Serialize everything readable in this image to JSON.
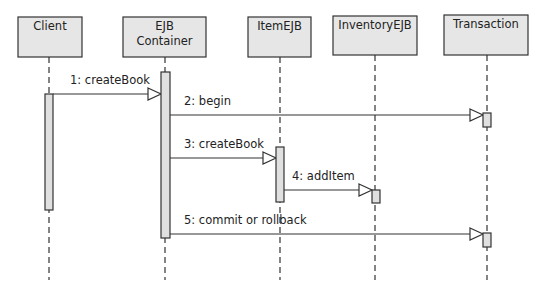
{
  "diagram": {
    "type": "uml-sequence",
    "colors": {
      "box_fill": "#e6e6e6",
      "stroke": "#333333",
      "activation_fill": "#e0e0e0",
      "text": "#222222"
    },
    "participants": [
      {
        "id": "client",
        "lines": [
          "Client"
        ],
        "box": [
          18,
          17,
          64,
          40
        ],
        "lifeline_x": 49
      },
      {
        "id": "container",
        "lines": [
          "EJB",
          "Container"
        ],
        "box": [
          123,
          17,
          83,
          40
        ],
        "lifeline_x": 165
      },
      {
        "id": "item",
        "lines": [
          "ItemEJB"
        ],
        "box": [
          248,
          17,
          63,
          40
        ],
        "lifeline_x": 280
      },
      {
        "id": "inventory",
        "lines": [
          "InventoryEJB"
        ],
        "box": [
          333,
          16,
          84,
          39
        ],
        "lifeline_x": 375
      },
      {
        "id": "transaction",
        "lines": [
          "Transaction"
        ],
        "box": [
          444,
          15,
          84,
          40
        ],
        "lifeline_x": 487
      }
    ],
    "activations": [
      {
        "participant": "client",
        "x": 45,
        "y": 94,
        "w": 8,
        "h": 116
      },
      {
        "participant": "container",
        "x": 161,
        "y": 72,
        "w": 9,
        "h": 166
      },
      {
        "participant": "item",
        "x": 276,
        "y": 147,
        "w": 8,
        "h": 55
      },
      {
        "participant": "inventory",
        "x": 372,
        "y": 190,
        "w": 8,
        "h": 13
      },
      {
        "participant": "transaction",
        "x": 483,
        "y": 113,
        "w": 8,
        "h": 14
      },
      {
        "participant": "transaction",
        "x": 483,
        "y": 233,
        "w": 8,
        "h": 14
      }
    ],
    "messages": [
      {
        "seq": "1",
        "label": "1: createBook",
        "from": "client",
        "to": "container",
        "x1": 53,
        "x2": 161,
        "y": 94,
        "label_x": 70,
        "label_y": 84
      },
      {
        "seq": "2",
        "label": "2: begin",
        "from": "container",
        "to": "transaction",
        "x1": 170,
        "x2": 483,
        "y": 115,
        "label_x": 184,
        "label_y": 105
      },
      {
        "seq": "3",
        "label": "3: createBook",
        "from": "container",
        "to": "item",
        "x1": 170,
        "x2": 276,
        "y": 158,
        "label_x": 184,
        "label_y": 148
      },
      {
        "seq": "4",
        "label": "4: addItem",
        "from": "item",
        "to": "inventory",
        "x1": 284,
        "x2": 372,
        "y": 190,
        "label_x": 292,
        "label_y": 180
      },
      {
        "seq": "5",
        "label": "5: commit or rollback",
        "from": "container",
        "to": "transaction",
        "x1": 170,
        "x2": 483,
        "y": 234,
        "label_x": 184,
        "label_y": 224
      }
    ],
    "lifeline_end_y": 280
  }
}
